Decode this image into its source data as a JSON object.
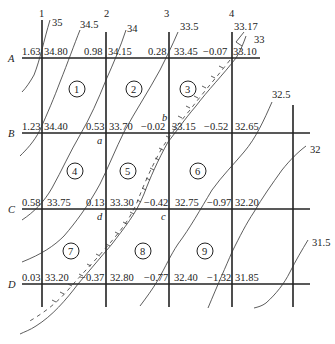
{
  "diagram": {
    "type": "earthwork-grid-contour-map",
    "columns": [
      {
        "label": "1",
        "x": 42
      },
      {
        "label": "2",
        "x": 106
      },
      {
        "label": "3",
        "x": 169
      },
      {
        "label": "4",
        "x": 232
      }
    ],
    "extra_column_x": 293,
    "rows": [
      {
        "label": "A",
        "y": 58
      },
      {
        "label": "B",
        "y": 133
      },
      {
        "label": "C",
        "y": 209
      },
      {
        "label": "D",
        "y": 284
      }
    ],
    "nodes": {
      "A": [
        {
          "cut_fill": "1.63",
          "elevation": "34.80"
        },
        {
          "cut_fill": "0.98",
          "elevation": "34.15"
        },
        {
          "cut_fill": "0.28",
          "elevation": "33.45"
        },
        {
          "cut_fill": "−0.07",
          "elevation": "33.10"
        }
      ],
      "B": [
        {
          "cut_fill": "1.23",
          "elevation": "34.40"
        },
        {
          "cut_fill": "0.53",
          "elevation": "33.70"
        },
        {
          "cut_fill": "−0.02",
          "elevation": "33.15"
        },
        {
          "cut_fill": "−0.52",
          "elevation": "32.65"
        }
      ],
      "C": [
        {
          "cut_fill": "0.58",
          "elevation": "33.75"
        },
        {
          "cut_fill": "0.13",
          "elevation": "33.30"
        },
        {
          "cut_fill": "−0.42",
          "elevation": "32.75"
        },
        {
          "cut_fill": "−0.97",
          "elevation": "32.20"
        }
      ],
      "D": [
        {
          "cut_fill": "0.03",
          "elevation": "33.20"
        },
        {
          "cut_fill": "−0.37",
          "elevation": "32.80"
        },
        {
          "cut_fill": "−0.77",
          "elevation": "32.40"
        },
        {
          "cut_fill": "−1.32",
          "elevation": "31.85"
        }
      ]
    },
    "cells": [
      "1",
      "2",
      "3",
      "4",
      "5",
      "6",
      "7",
      "8",
      "9"
    ],
    "points": {
      "a": "a",
      "b": "b",
      "c": "c",
      "d": "d"
    },
    "contours": [
      "35",
      "34.5",
      "34",
      "33.5",
      "33.17",
      "33",
      "32.5",
      "32",
      "31.5"
    ],
    "zero_line_label": "33.17"
  }
}
